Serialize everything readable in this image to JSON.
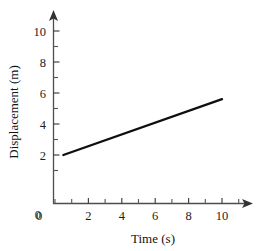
{
  "chart_data": {
    "type": "line",
    "title": "",
    "subtitle": "",
    "xlabel": "Time (s)",
    "ylabel": "Displacement (m)",
    "xlim": [
      0,
      11.8
    ],
    "ylim": [
      0,
      11.2
    ],
    "xticks": [
      0,
      1,
      2,
      3,
      4,
      5,
      6,
      7,
      8,
      9,
      10,
      11
    ],
    "yticks": [
      0,
      1,
      2,
      3,
      4,
      5,
      6,
      7,
      8,
      9,
      10
    ],
    "xtick_labels": [
      "0",
      "2",
      "4",
      "6",
      "8",
      "10"
    ],
    "xtick_label_values": [
      0,
      2,
      4,
      6,
      8,
      10
    ],
    "ytick_labels": [
      "0",
      "2",
      "4",
      "6",
      "8",
      "10"
    ],
    "ytick_label_values": [
      0,
      2,
      4,
      6,
      8,
      10
    ],
    "grid": false,
    "legend": false,
    "legend_position": "none",
    "axis_style": "arrow-terminated",
    "line_color": "#100f0f",
    "axis_color": "#4d4d4d",
    "background_color": "#ffffff",
    "series": [
      {
        "name": "displacement",
        "x": [
          0.5,
          10.0
        ],
        "y": [
          2.0,
          5.6
        ],
        "slope": 0.379,
        "intercept": 1.81,
        "points": [
          {
            "x": 0.5,
            "y": 2.0
          },
          {
            "x": 2.0,
            "y": 2.57
          },
          {
            "x": 4.0,
            "y": 3.33
          },
          {
            "x": 6.0,
            "y": 4.08
          },
          {
            "x": 8.0,
            "y": 4.84
          },
          {
            "x": 10.0,
            "y": 5.6
          }
        ]
      }
    ],
    "annotations": []
  },
  "labels": {
    "x_axis_title": "Time (s)",
    "y_axis_title": "Displacement (m)"
  }
}
